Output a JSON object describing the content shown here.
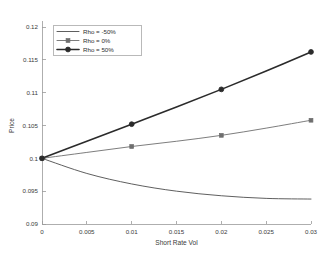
{
  "chart_data": {
    "type": "line",
    "title": "",
    "xlabel": "Short Rate Vol",
    "ylabel": "Price",
    "xlim": [
      0,
      0.03
    ],
    "ylim": [
      0.09,
      0.12
    ],
    "xticks": [
      "0",
      "0.005",
      "0.01",
      "0.015",
      "0.02",
      "0.025",
      "0.03"
    ],
    "xtick_values": [
      0,
      0.005,
      0.01,
      0.015,
      0.02,
      0.025,
      0.03
    ],
    "yticks": [
      "0.09",
      "0.095",
      "0.1",
      "0.105",
      "0.11",
      "0.115",
      "0.12"
    ],
    "ytick_values": [
      0.09,
      0.095,
      0.1,
      0.105,
      0.11,
      0.115,
      0.12
    ],
    "grid": false,
    "legend_position": "top-left",
    "x": [
      0,
      0.005,
      0.01,
      0.015,
      0.02,
      0.025,
      0.03
    ],
    "series": [
      {
        "name": "Rho = -50%",
        "color": "#4d4d4d",
        "marker": "none",
        "linewidth": 0.9,
        "values": [
          0.1,
          0.0977,
          0.0961,
          0.095,
          0.0943,
          0.0939,
          0.0938
        ]
      },
      {
        "name": "Rho = 0%",
        "color": "#6e6e6e",
        "marker": "square",
        "linewidth": 0.9,
        "marker_x": [
          0,
          0.01,
          0.02,
          0.03
        ],
        "marker_values": [
          0.1,
          0.1018,
          0.1035,
          0.1058
        ],
        "values": [
          0.1,
          0.1009,
          0.1018,
          0.1026,
          0.1035,
          0.1046,
          0.1058
        ]
      },
      {
        "name": "Rho = 50%",
        "color": "#2b2b2b",
        "marker": "circle",
        "linewidth": 1.6,
        "marker_x": [
          0,
          0.01,
          0.02,
          0.03
        ],
        "marker_values": [
          0.1,
          0.1052,
          0.1105,
          0.1162
        ],
        "values": [
          0.1,
          0.1026,
          0.1052,
          0.1078,
          0.1105,
          0.1133,
          0.1162
        ]
      }
    ]
  },
  "legend": {
    "entries": [
      {
        "label": "Rho = -50%"
      },
      {
        "label": "Rho = 0%"
      },
      {
        "label": "Rho = 50%"
      }
    ]
  },
  "axes": {
    "x_title": "Short Rate Vol",
    "y_title": "Price"
  }
}
